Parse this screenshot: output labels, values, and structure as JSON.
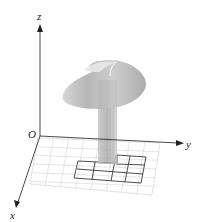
{
  "figure": {
    "axes": {
      "x_label": "x",
      "y_label": "y",
      "z_label": "z",
      "origin_label": "O"
    },
    "colors": {
      "axis": "#333333",
      "grid_light": "#cfcfcf",
      "grid_dark": "#444444",
      "surface": "#b8b8b8",
      "column": "#bdbdbd"
    },
    "grid": {
      "light_rows": 6,
      "light_cols": 8,
      "highlighted_cells_rows": 3,
      "highlighted_cells_cols": 3
    }
  }
}
